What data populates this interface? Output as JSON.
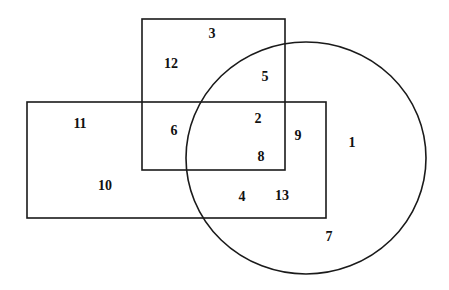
{
  "diagram": {
    "type": "venn",
    "colors": {
      "stroke": "#1a1a1a",
      "background": "#ffffff",
      "text": "#111111"
    },
    "shapes": {
      "top_rectangle": {
        "x": 142,
        "y": 19,
        "width": 143,
        "height": 151
      },
      "wide_rectangle": {
        "x": 27,
        "y": 102,
        "width": 299,
        "height": 116
      },
      "circle": {
        "cx": 306,
        "cy": 158,
        "rx": 120,
        "ry": 116
      }
    },
    "regions": [
      {
        "label": "3",
        "x": 212,
        "y": 33
      },
      {
        "label": "12",
        "x": 171,
        "y": 63
      },
      {
        "label": "5",
        "x": 265,
        "y": 76
      },
      {
        "label": "11",
        "x": 80,
        "y": 123
      },
      {
        "label": "6",
        "x": 174,
        "y": 130
      },
      {
        "label": "2",
        "x": 258,
        "y": 118
      },
      {
        "label": "9",
        "x": 298,
        "y": 135
      },
      {
        "label": "1",
        "x": 352,
        "y": 142
      },
      {
        "label": "8",
        "x": 261,
        "y": 156
      },
      {
        "label": "10",
        "x": 105,
        "y": 185
      },
      {
        "label": "4",
        "x": 242,
        "y": 196
      },
      {
        "label": "13",
        "x": 282,
        "y": 195
      },
      {
        "label": "7",
        "x": 329,
        "y": 236
      }
    ]
  }
}
